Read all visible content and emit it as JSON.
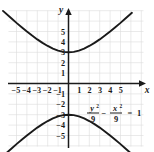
{
  "figure": {
    "title": "",
    "axis_labels": {
      "x": "x",
      "y": "y"
    },
    "equation": {
      "full": "y^2/9 - x^2/9 = 1",
      "num1_var": "y",
      "num1_exp": "2",
      "den1": "9",
      "operator": "−",
      "num2_var": "x",
      "num2_exp": "2",
      "den2": "9",
      "equals": "=",
      "rhs": "1"
    },
    "colors": {
      "curve": "#1a1a1a",
      "axis": "#1a1a1a",
      "grid": "#dcdcdc",
      "background": "#ffffff",
      "text": "#1a1a1a"
    }
  },
  "chart_data": {
    "type": "line",
    "title": "",
    "xlabel": "x",
    "ylabel": "y",
    "xlim": [
      -6.3,
      6.1
    ],
    "ylim": [
      -6.3,
      6.3
    ],
    "xticks": [
      -5,
      -4,
      -3,
      -2,
      -1,
      1,
      2,
      3,
      4,
      5
    ],
    "xtick_labels": [
      "-5",
      "-4",
      "-3",
      "-2",
      "-1",
      "1",
      "2",
      "3",
      "4",
      "5"
    ],
    "yticks": [
      5,
      4,
      3,
      2,
      1,
      -1,
      -2,
      -3,
      -4,
      -5
    ],
    "ytick_labels": [
      "5",
      "4",
      "3",
      "2",
      "1",
      "-1",
      "-2",
      "-3",
      "-4",
      "-5"
    ],
    "grid": true,
    "grid_step": 1,
    "legend": "none",
    "annotations": [
      {
        "text": "y^2/9 - x^2/9 = 1",
        "x": 2.6,
        "y": -3.2
      }
    ],
    "series": [
      {
        "name": "upper branch",
        "equation": "y = 3*sqrt(1 + x^2/9)",
        "x": [
          -6.3,
          -5.5,
          -5,
          -4.5,
          -4,
          -3.5,
          -3,
          -2.5,
          -2,
          -1.5,
          -1,
          -0.5,
          0,
          0.5,
          1,
          1.5,
          2,
          2.5,
          3,
          3.5,
          4,
          4.5,
          5,
          5.5,
          6.1
        ],
        "y": [
          6.98,
          6.27,
          5.83,
          5.41,
          5.0,
          4.61,
          4.24,
          3.91,
          3.61,
          3.35,
          3.16,
          3.04,
          3.0,
          3.04,
          3.16,
          3.35,
          3.61,
          3.91,
          4.24,
          4.61,
          5.0,
          5.41,
          5.83,
          6.27,
          6.8
        ]
      },
      {
        "name": "lower branch",
        "equation": "y = -3*sqrt(1 + x^2/9)",
        "x": [
          -6.3,
          -5.5,
          -5,
          -4.5,
          -4,
          -3.5,
          -3,
          -2.5,
          -2,
          -1.5,
          -1,
          -0.5,
          0,
          0.5,
          1,
          1.5,
          2,
          2.5,
          3,
          3.5,
          4,
          4.5,
          5,
          5.5,
          6.1
        ],
        "y": [
          -6.98,
          -6.27,
          -5.83,
          -5.41,
          -5.0,
          -4.61,
          -4.24,
          -3.91,
          -3.61,
          -3.35,
          -3.16,
          -3.04,
          -3.0,
          -3.04,
          -3.16,
          -3.35,
          -3.61,
          -3.91,
          -4.24,
          -4.61,
          -5.0,
          -5.41,
          -5.83,
          -6.27,
          -6.8
        ]
      }
    ],
    "vertices": [
      [
        0,
        3
      ],
      [
        0,
        -3
      ]
    ]
  }
}
